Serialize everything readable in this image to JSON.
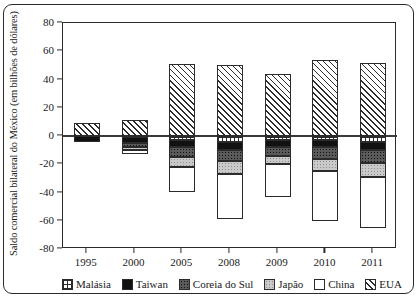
{
  "chart_data": {
    "type": "bar",
    "subtype": "stacked-bar-diverging",
    "title": "",
    "xlabel": "",
    "ylabel": "Saldo comercial bilateral do México (em bilhões de dólares)",
    "categories": [
      "1995",
      "2000",
      "2005",
      "2008",
      "2009",
      "2010",
      "2011"
    ],
    "ylim": [
      -80,
      80
    ],
    "yticks": [
      80,
      60,
      40,
      20,
      0,
      -20,
      -40,
      -60,
      -80
    ],
    "ytick_labels": [
      "80",
      "60",
      "40",
      "20",
      "0",
      "-20",
      "-40",
      "-60",
      "-80"
    ],
    "grid": false,
    "legend_position": "bottom",
    "zero_reference_line": true,
    "series": [
      {
        "name": "Malásia",
        "pattern": "checkered",
        "color": "#ffffff",
        "values": [
          0,
          -1,
          -3,
          -4,
          -3,
          -3,
          -4
        ]
      },
      {
        "name": "Taiwan",
        "pattern": "solid-black",
        "color": "#111111",
        "values": [
          -4,
          -4,
          -5,
          -6,
          -5,
          -5,
          -6
        ]
      },
      {
        "name": "Coreia do Sul",
        "pattern": "dark-gray-dotted",
        "color": "#5a5a5a",
        "values": [
          0,
          -3,
          -7,
          -8,
          -6,
          -8,
          -9
        ]
      },
      {
        "name": "Japão",
        "pattern": "light-gray-dotted",
        "color": "#c9c9c9",
        "values": [
          0,
          -2,
          -7,
          -9,
          -6,
          -9,
          -10
        ]
      },
      {
        "name": "China",
        "pattern": "white",
        "color": "#ffffff",
        "values": [
          0,
          -3,
          -18,
          -32,
          -23,
          -35,
          -36
        ]
      },
      {
        "name": "EUA",
        "pattern": "diagonal-hatch",
        "color": "#ffffff",
        "values": [
          9,
          11,
          51,
          50,
          44,
          54,
          52
        ]
      }
    ],
    "annotations": []
  },
  "legend": {
    "items": [
      {
        "label": "Malásia"
      },
      {
        "label": "Taiwan"
      },
      {
        "label": "Coreia do Sul"
      },
      {
        "label": "Japão"
      },
      {
        "label": "China"
      },
      {
        "label": "EUA"
      }
    ]
  }
}
